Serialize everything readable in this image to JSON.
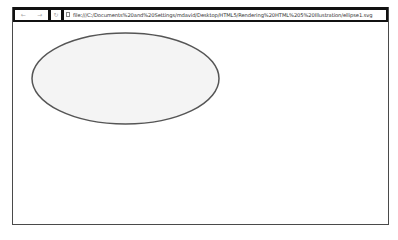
{
  "browser": {
    "nav": {
      "back_icon": "←",
      "forward_icon": "→",
      "reload_icon": "↻"
    },
    "address_bar": {
      "page_icon": "page-icon",
      "url": "file:///C:/Documents%20and%20Settings/mdavid/Desktop/HTML5/Rendering%20HTML%205%20Illustration/ellipse1.svg"
    }
  },
  "content": {
    "shape": {
      "type": "ellipse",
      "cx": 124.5,
      "cy": 78.5,
      "rx": 93.5,
      "ry": 45.5,
      "fill": "#f4f4f4",
      "stroke": "#555555",
      "stroke_width": 1.5
    }
  }
}
